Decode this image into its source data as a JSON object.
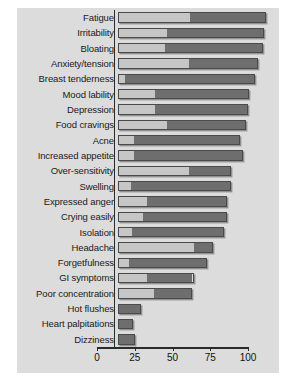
{
  "chart_data": {
    "type": "bar",
    "orientation": "horizontal",
    "stacked": true,
    "title": "",
    "subtitle": "",
    "xlabel": "",
    "ylabel": "",
    "xlim": [
      0,
      100
    ],
    "ylim": null,
    "grid": false,
    "legend_position": "none",
    "xticks": [
      0,
      25,
      50,
      75,
      100
    ],
    "xticklabels": [
      "0",
      "25",
      "50",
      "75",
      "100"
    ],
    "categories": [
      "Fatigue",
      "Irritability",
      "Bloating",
      "Anxiety/tension",
      "Breast tenderness",
      "Mood lability",
      "Depression",
      "Food cravings",
      "Acne",
      "Increased appetite",
      "Over-sensitivity",
      "Swelling",
      "Expressed anger",
      "Crying easily",
      "Isolation",
      "Headache",
      "Forgetfulness",
      "GI symptoms",
      "Poor concentration",
      "Hot flushes",
      "Heart palpitations",
      "Dizziness"
    ],
    "series": [
      {
        "name": "light-segment",
        "color": "#c6c6c6",
        "values": [
          48,
          32,
          31,
          47,
          4,
          24,
          24,
          32,
          10,
          10,
          47,
          8,
          19,
          16,
          9,
          51,
          7,
          19,
          24,
          0,
          0,
          0
        ]
      },
      {
        "name": "dark-segment",
        "color": "#6e6e6e",
        "values": [
          50,
          65,
          65,
          46,
          87,
          63,
          62,
          53,
          71,
          73,
          28,
          67,
          53,
          56,
          61,
          12,
          52,
          31,
          25,
          15,
          10,
          11
        ]
      }
    ],
    "totals": [
      98,
      97,
      96,
      93,
      91,
      87,
      86,
      85,
      81,
      83,
      75,
      75,
      72,
      72,
      70,
      63,
      59,
      50,
      49,
      15,
      10,
      11
    ],
    "colors": {
      "panel_background": "#dcdcdc",
      "page_background": "#ffffff",
      "light_segment": "#c6c6c6",
      "dark_segment": "#6e6e6e",
      "bar_outline": "#4a4a4a",
      "axis": "#2b2b2b",
      "text": "#1a1a1a"
    }
  }
}
